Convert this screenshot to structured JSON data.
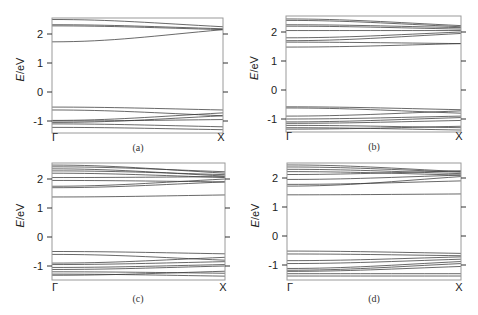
{
  "figure": {
    "ylabel_italic": "E",
    "ylabel_rest": "/eV",
    "x_tick_labels": [
      "Γ",
      "X"
    ],
    "y_tick_labels": [
      "2",
      "1",
      "0",
      "-1"
    ]
  },
  "chart_data": [
    {
      "type": "line",
      "panel": "(a)",
      "caption": "(a)",
      "xlabel": "",
      "ylabel": "E/eV",
      "x_ticks": [
        "Γ",
        "X"
      ],
      "y_ticks": [
        2,
        1,
        0,
        -1
      ],
      "ylim": [
        -1.45,
        2.55
      ],
      "grid": false,
      "bands_gamma_to_x": [
        [
          2.5,
          2.25
        ],
        [
          2.32,
          2.18
        ],
        [
          2.28,
          2.15
        ],
        [
          1.73,
          2.15
        ],
        [
          -0.52,
          -0.62
        ],
        [
          -0.62,
          -0.82
        ],
        [
          -0.98,
          -0.72
        ],
        [
          -1.0,
          -0.95
        ],
        [
          -1.05,
          -0.82
        ],
        [
          -1.22,
          -1.3
        ],
        [
          -1.1,
          -1.2
        ]
      ]
    },
    {
      "type": "line",
      "panel": "(b)",
      "caption": "(b)",
      "xlabel": "",
      "ylabel": "E/eV",
      "x_ticks": [
        "Γ",
        "X"
      ],
      "y_ticks": [
        2,
        1,
        0,
        -1
      ],
      "ylim": [
        -1.45,
        2.55
      ],
      "grid": false,
      "bands_gamma_to_x": [
        [
          2.45,
          2.22
        ],
        [
          2.4,
          2.18
        ],
        [
          2.25,
          2.15
        ],
        [
          2.2,
          2.1
        ],
        [
          2.05,
          2.05
        ],
        [
          1.8,
          2.0
        ],
        [
          1.7,
          1.95
        ],
        [
          1.65,
          1.6
        ],
        [
          1.48,
          1.6
        ],
        [
          -0.58,
          -0.68
        ],
        [
          -0.62,
          -0.8
        ],
        [
          -0.9,
          -0.72
        ],
        [
          -1.0,
          -0.9
        ],
        [
          -1.1,
          -0.95
        ],
        [
          -1.15,
          -1.05
        ],
        [
          -1.22,
          -1.3
        ],
        [
          -1.3,
          -1.38
        ],
        [
          -1.35,
          -1.25
        ]
      ]
    },
    {
      "type": "line",
      "panel": "(c)",
      "caption": "(c)",
      "xlabel": "",
      "ylabel": "E/eV",
      "x_ticks": [
        "Γ",
        "X"
      ],
      "y_ticks": [
        2,
        1,
        0,
        -1
      ],
      "ylim": [
        -1.45,
        2.55
      ],
      "grid": false,
      "bands_gamma_to_x": [
        [
          2.48,
          2.2
        ],
        [
          2.42,
          2.25
        ],
        [
          2.35,
          2.1
        ],
        [
          2.28,
          2.15
        ],
        [
          2.2,
          2.05
        ],
        [
          2.05,
          2.08
        ],
        [
          1.95,
          1.9
        ],
        [
          1.75,
          2.0
        ],
        [
          1.7,
          1.9
        ],
        [
          1.38,
          1.45
        ],
        [
          -0.5,
          -0.58
        ],
        [
          -0.6,
          -0.8
        ],
        [
          -0.9,
          -0.7
        ],
        [
          -0.95,
          -0.85
        ],
        [
          -1.05,
          -0.95
        ],
        [
          -1.12,
          -1.0
        ],
        [
          -1.2,
          -1.25
        ],
        [
          -1.28,
          -1.35
        ],
        [
          -1.32,
          -1.18
        ]
      ]
    },
    {
      "type": "line",
      "panel": "(d)",
      "caption": "(d)",
      "xlabel": "",
      "ylabel": "E/eV",
      "x_ticks": [
        "Γ",
        "X"
      ],
      "y_ticks": [
        2,
        1,
        0,
        -1
      ],
      "ylim": [
        -1.45,
        2.55
      ],
      "grid": false,
      "bands_gamma_to_x": [
        [
          2.45,
          2.22
        ],
        [
          2.38,
          2.2
        ],
        [
          2.3,
          2.15
        ],
        [
          2.22,
          2.1
        ],
        [
          2.12,
          2.25
        ],
        [
          1.95,
          2.1
        ],
        [
          1.78,
          1.9
        ],
        [
          1.72,
          2.05
        ],
        [
          1.42,
          1.45
        ],
        [
          -0.52,
          -0.6
        ],
        [
          -0.62,
          -0.68
        ],
        [
          -0.85,
          -0.72
        ],
        [
          -0.95,
          -0.8
        ],
        [
          -1.12,
          -0.88
        ],
        [
          -1.18,
          -0.95
        ],
        [
          -1.22,
          -1.05
        ],
        [
          -1.3,
          -1.3
        ],
        [
          -1.38,
          -1.38
        ]
      ]
    }
  ],
  "layout": {
    "panels": [
      {
        "left": 52,
        "top": 18,
        "right": 223,
        "bottom": 133,
        "y2": 34,
        "y_per_ev": 29,
        "caption_x": 138,
        "caption_y": 151,
        "label_y": 141
      },
      {
        "left": 286,
        "top": 16,
        "right": 461,
        "bottom": 132,
        "y2": 32,
        "y_per_ev": 29,
        "caption_x": 374,
        "caption_y": 150,
        "label_y": 140
      },
      {
        "left": 52,
        "top": 163,
        "right": 225,
        "bottom": 280,
        "y2": 179,
        "y_per_ev": 29,
        "caption_x": 138,
        "caption_y": 302,
        "label_y": 291
      },
      {
        "left": 287,
        "top": 163,
        "right": 461,
        "bottom": 280,
        "y2": 178,
        "y_per_ev": 29,
        "caption_x": 374,
        "caption_y": 302,
        "label_y": 291
      }
    ]
  }
}
